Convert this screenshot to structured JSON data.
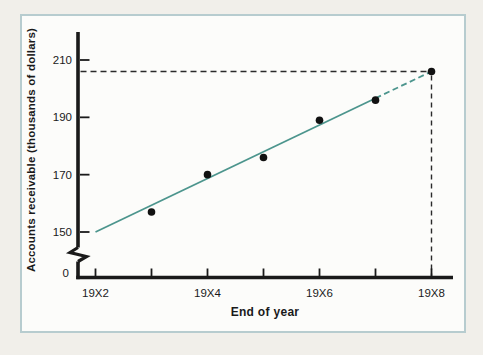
{
  "page": {
    "background": "#f1efea"
  },
  "frame": {
    "border_color": "#b7cccf",
    "background": "#fcfcfa"
  },
  "chart_data": {
    "type": "scatter",
    "title": "",
    "xlabel": "End of year",
    "ylabel": "Accounts receivable (thousands of dollars)",
    "x_categories": [
      "19X2",
      "19X3",
      "19X4",
      "19X5",
      "19X6",
      "19X7",
      "19X8"
    ],
    "x_tick_labels_shown": [
      "19X2",
      "19X4",
      "19X6",
      "19X8"
    ],
    "y_ticks": [
      210,
      190,
      170,
      150
    ],
    "y_origin_label": "0",
    "y_axis_break": true,
    "ylim": [
      150,
      215
    ],
    "grid": false,
    "legend": null,
    "series": [
      {
        "name": "Observed accounts receivable",
        "points": [
          {
            "x": "19X3",
            "y": 157
          },
          {
            "x": "19X4",
            "y": 170
          },
          {
            "x": "19X5",
            "y": 176
          },
          {
            "x": "19X6",
            "y": 189
          },
          {
            "x": "19X7",
            "y": 196
          }
        ]
      }
    ],
    "forecast_point": {
      "x": "19X8",
      "y": 206
    },
    "trendline": {
      "from": {
        "x": "19X2",
        "y": 150
      },
      "to": {
        "x": "19X8",
        "y": 206
      },
      "solid_until": "19X7",
      "color": "#4c958d"
    },
    "guides": {
      "horizontal_dashed": {
        "y": 206,
        "from_axis": true,
        "to_x": "19X8"
      },
      "vertical_dashed": {
        "x": "19X8",
        "from_y": 206,
        "to_axis": true
      }
    },
    "colors": {
      "axis": "#1a1a1a",
      "point": "#111111",
      "dashed_guide": "#2a2a2a",
      "text": "#1a1a1a"
    }
  }
}
